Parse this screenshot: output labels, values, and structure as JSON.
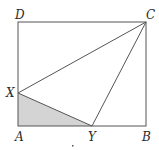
{
  "diagram": {
    "type": "geometry",
    "colors": {
      "stroke": "#555555",
      "shade": "#d4d4d4",
      "background": "#ffffff"
    },
    "points": {
      "A": {
        "label": "A",
        "x": 18,
        "y": 126
      },
      "B": {
        "label": "B",
        "x": 146,
        "y": 126
      },
      "C": {
        "label": "C",
        "x": 146,
        "y": 22
      },
      "D": {
        "label": "D",
        "x": 18,
        "y": 22
      },
      "X": {
        "label": "X",
        "x": 18,
        "y": 93
      },
      "Y": {
        "label": "Y",
        "x": 92,
        "y": 126
      }
    },
    "labels": {
      "A": "A",
      "B": "B",
      "C": "C",
      "D": "D",
      "X": "X",
      "Y": "Y"
    },
    "segments": [
      [
        "A",
        "B"
      ],
      [
        "B",
        "C"
      ],
      [
        "C",
        "D"
      ],
      [
        "D",
        "A"
      ],
      [
        "X",
        "C"
      ],
      [
        "Y",
        "C"
      ],
      [
        "X",
        "Y"
      ]
    ],
    "shaded_region": [
      "A",
      "X",
      "Y"
    ]
  }
}
